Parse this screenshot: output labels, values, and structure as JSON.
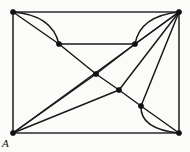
{
  "figure": {
    "background_color": "#fbfbf9",
    "edge_color": "#1a1a1a",
    "vertex_color": "#111111",
    "width": 190,
    "height": 152
  },
  "labels": {
    "vertex_a": "A"
  },
  "chart_data": {
    "type": "diagram",
    "title": "",
    "vertices": [
      {
        "id": "TL",
        "x": 13,
        "y": 12,
        "label": ""
      },
      {
        "id": "TR",
        "x": 179,
        "y": 12,
        "label": ""
      },
      {
        "id": "BL",
        "x": 13,
        "y": 133,
        "label": "A"
      },
      {
        "id": "BR",
        "x": 179,
        "y": 133,
        "label": ""
      },
      {
        "id": "P",
        "x": 59,
        "y": 44,
        "label": ""
      },
      {
        "id": "Q",
        "x": 135,
        "y": 44,
        "label": ""
      },
      {
        "id": "C",
        "x": 96,
        "y": 74,
        "label": ""
      },
      {
        "id": "R",
        "x": 119,
        "y": 90,
        "label": ""
      },
      {
        "id": "S",
        "x": 141,
        "y": 106,
        "label": ""
      }
    ],
    "edges": [
      {
        "from": "TL",
        "to": "TR",
        "kind": "straight"
      },
      {
        "from": "TL",
        "to": "BL",
        "kind": "straight"
      },
      {
        "from": "TR",
        "to": "BR",
        "kind": "straight"
      },
      {
        "from": "BL",
        "to": "BR",
        "kind": "straight"
      },
      {
        "from": "TL",
        "to": "P",
        "kind": "straight"
      },
      {
        "from": "TL",
        "to": "P",
        "kind": "curve",
        "cx": 52,
        "cy": 15
      },
      {
        "from": "P",
        "to": "Q",
        "kind": "straight"
      },
      {
        "from": "P",
        "to": "C",
        "kind": "straight"
      },
      {
        "from": "TR",
        "to": "Q",
        "kind": "straight"
      },
      {
        "from": "TR",
        "to": "Q",
        "kind": "curve",
        "cx": 140,
        "cy": 16
      },
      {
        "from": "Q",
        "to": "C",
        "kind": "straight"
      },
      {
        "from": "TR",
        "to": "R",
        "kind": "straight"
      },
      {
        "from": "TR",
        "to": "S",
        "kind": "straight"
      },
      {
        "from": "TR",
        "to": "BL",
        "kind": "straight"
      },
      {
        "from": "C",
        "to": "R",
        "kind": "straight"
      },
      {
        "from": "C",
        "to": "BL",
        "kind": "straight"
      },
      {
        "from": "R",
        "to": "S",
        "kind": "straight"
      },
      {
        "from": "R",
        "to": "BL",
        "kind": "straight"
      },
      {
        "from": "S",
        "to": "BR",
        "kind": "straight"
      },
      {
        "from": "S",
        "to": "BR",
        "kind": "curve",
        "cx": 140,
        "cy": 129
      }
    ],
    "vertex_radius": 2.6
  }
}
